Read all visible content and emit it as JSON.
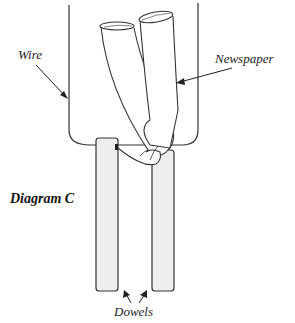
{
  "diagram": {
    "title": "Diagram C",
    "labels": {
      "wire": "Wire",
      "newspaper": "Newspaper",
      "dowels": "Dowels"
    },
    "colors": {
      "line": "#333333",
      "dowel_fill": "#efefef",
      "background": "#ffffff"
    }
  }
}
